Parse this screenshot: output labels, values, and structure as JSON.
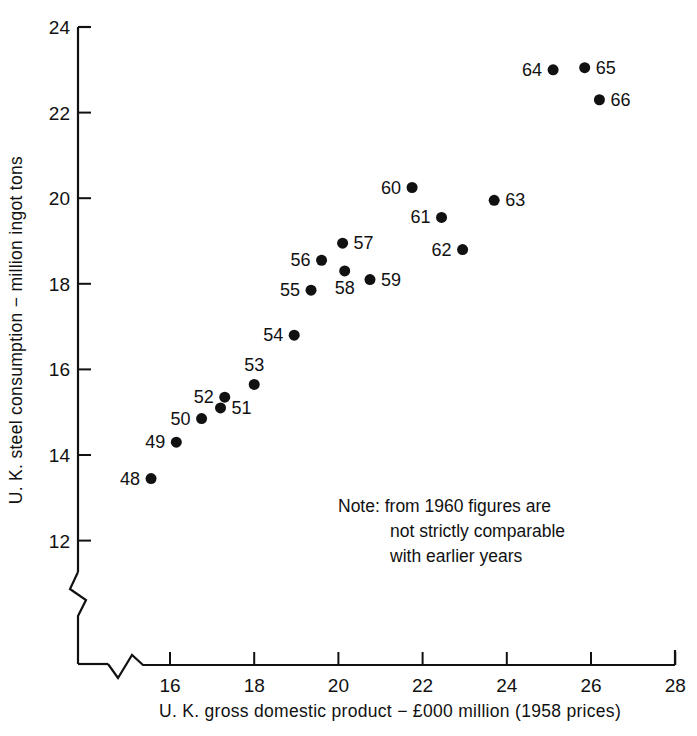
{
  "chart_data": {
    "type": "scatter",
    "title": "",
    "xlabel": "U. K. gross domestic product − £000 million (1958 prices)",
    "ylabel": "U. K. steel consumption − million ingot tons",
    "xlim": [
      15.2,
      28.0
    ],
    "ylim": [
      11.3,
      24.0
    ],
    "xticks": [
      16,
      18,
      20,
      22,
      24,
      26,
      28
    ],
    "xtick_labels": [
      "16",
      "18",
      "20",
      "22",
      "24",
      "26",
      "28"
    ],
    "yticks": [
      12,
      14,
      16,
      18,
      20,
      22,
      24
    ],
    "ytick_labels": [
      "12",
      "14",
      "16",
      "18",
      "20",
      "22",
      "24"
    ],
    "grid": false,
    "legend": "none",
    "axis_break_x": true,
    "axis_break_y": true,
    "point_labels": [
      "48",
      "49",
      "50",
      "51",
      "52",
      "53",
      "54",
      "55",
      "56",
      "57",
      "58",
      "59",
      "60",
      "61",
      "62",
      "63",
      "64",
      "65",
      "66"
    ],
    "x": [
      15.55,
      16.15,
      16.75,
      17.2,
      17.3,
      18.0,
      18.95,
      19.35,
      19.6,
      20.1,
      20.15,
      20.75,
      21.75,
      22.45,
      22.95,
      23.7,
      25.1,
      25.85,
      26.2
    ],
    "y": [
      13.45,
      14.3,
      14.85,
      15.1,
      15.35,
      15.65,
      16.8,
      17.85,
      18.55,
      18.95,
      18.3,
      18.1,
      20.25,
      19.55,
      18.8,
      19.95,
      23.0,
      23.05,
      22.3
    ],
    "label_side": [
      "left",
      "left",
      "left",
      "right",
      "left",
      "above",
      "left",
      "left",
      "left",
      "right",
      "below",
      "right",
      "left",
      "left",
      "left",
      "right",
      "left",
      "right",
      "right"
    ],
    "marker": "filled-circle",
    "marker_color": "#111111",
    "marker_size": 5.5
  },
  "annotations": {
    "note": {
      "lines": [
        "Note: from 1960 figures are",
        "not strictly comparable",
        "with earlier years"
      ]
    }
  }
}
